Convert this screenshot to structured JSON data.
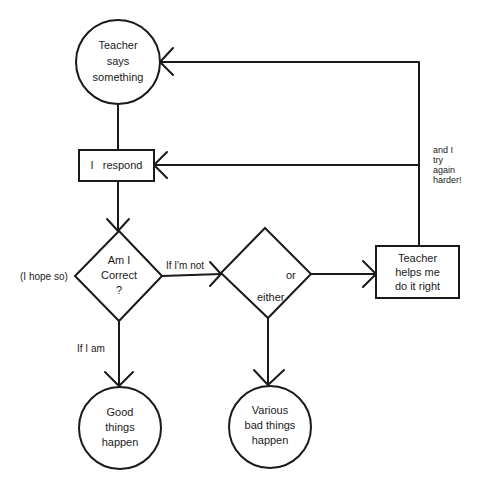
{
  "diagram": {
    "type": "flowchart",
    "colors": {
      "stroke": "#1a1a1a",
      "background": "#ffffff"
    },
    "nodes": {
      "teacher_says": {
        "shape": "circle",
        "lines": [
          "Teacher",
          "says",
          "something"
        ]
      },
      "i_respond": {
        "shape": "rectangle",
        "label": "I   respond"
      },
      "am_i_correct": {
        "shape": "diamond",
        "lines": [
          "Am I",
          "Correct",
          "?"
        ]
      },
      "either_or": {
        "shape": "diamond",
        "label_or": "or",
        "label_either": "either"
      },
      "teacher_helps": {
        "shape": "rectangle",
        "lines": [
          "Teacher",
          "helps me",
          "do it right"
        ]
      },
      "good_things": {
        "shape": "circle",
        "lines": [
          "Good",
          "things",
          "happen"
        ]
      },
      "bad_things": {
        "shape": "circle",
        "lines": [
          "Various",
          "bad things",
          "happen"
        ]
      }
    },
    "edge_labels": {
      "hope_so": "(I hope so)",
      "if_not": "If I'm not",
      "if_am": "If I am",
      "try_again": [
        "and I",
        "try",
        "again",
        "harder!"
      ]
    },
    "edges": [
      {
        "from": "teacher_says",
        "to": "i_respond"
      },
      {
        "from": "i_respond",
        "to": "am_i_correct"
      },
      {
        "from": "am_i_correct",
        "to": "either_or",
        "label": "If I'm not"
      },
      {
        "from": "am_i_correct",
        "to": "good_things",
        "label": "If I am"
      },
      {
        "from": "either_or",
        "to": "teacher_helps"
      },
      {
        "from": "either_or",
        "to": "bad_things"
      },
      {
        "from": "teacher_helps",
        "to": "i_respond",
        "label": "and I try again harder!"
      },
      {
        "from": "teacher_helps",
        "to": "teacher_says"
      }
    ]
  }
}
